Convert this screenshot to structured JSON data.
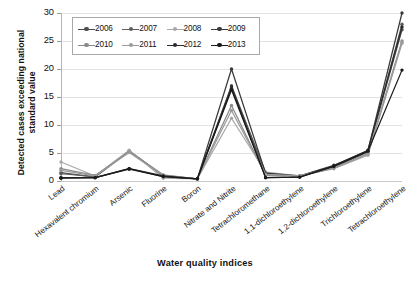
{
  "chart_data": {
    "type": "line",
    "title": "",
    "xlabel": "Water quality indices",
    "ylabel": "Detected cases exceeding national standard value",
    "ylim": [
      0,
      30
    ],
    "yticks": [
      0,
      5,
      10,
      15,
      20,
      25,
      30
    ],
    "grid": true,
    "legend_position": "top-left",
    "categories": [
      "Lead",
      "Hexavalent chromium",
      "Arsenic",
      "Fluorine",
      "Boron",
      "Nitrate and Nitrite",
      "Tetrachloromethane",
      "1,1-dichloroethylene",
      "1,2-dichloroethylene",
      "Trichloroethylene",
      "Tetrachloroethylene"
    ],
    "series": [
      {
        "name": "2006",
        "color": "#4d4d4d",
        "values": [
          1.5,
          0.7,
          5.3,
          0.9,
          0.4,
          17.0,
          1.5,
          0.8,
          2.6,
          5.3,
          27.0
        ]
      },
      {
        "name": "2007",
        "color": "#5e5e5e",
        "values": [
          1.3,
          0.8,
          5.4,
          1.0,
          0.4,
          16.5,
          1.4,
          0.8,
          2.5,
          5.2,
          28.0
        ]
      },
      {
        "name": "2008",
        "color": "#a8a8a8",
        "values": [
          3.4,
          0.9,
          5.5,
          0.5,
          0.4,
          11.2,
          1.6,
          0.9,
          2.2,
          4.6,
          24.6
        ]
      },
      {
        "name": "2009",
        "color": "#3a3a3a",
        "values": [
          0.6,
          0.6,
          2.1,
          0.8,
          0.4,
          20.0,
          1.4,
          0.9,
          2.8,
          5.4,
          30.0
        ]
      },
      {
        "name": "2010",
        "color": "#8b8b8b",
        "values": [
          2.2,
          1.0,
          5.2,
          1.1,
          0.4,
          13.5,
          1.0,
          0.9,
          2.3,
          4.9,
          25.0
        ]
      },
      {
        "name": "2011",
        "color": "#9b9b9b",
        "values": [
          1.9,
          0.9,
          5.1,
          1.0,
          0.4,
          12.6,
          1.2,
          0.9,
          2.4,
          4.8,
          24.8
        ]
      },
      {
        "name": "2012",
        "color": "#2b2b2b",
        "values": [
          0.6,
          0.6,
          2.2,
          0.9,
          0.4,
          16.8,
          0.6,
          0.7,
          2.7,
          5.5,
          27.5
        ]
      },
      {
        "name": "2013",
        "color": "#1a1a1a",
        "values": [
          0.5,
          0.6,
          2.2,
          0.8,
          0.4,
          16.3,
          0.6,
          0.7,
          2.6,
          5.3,
          19.8
        ]
      }
    ]
  },
  "axes": {
    "y_title": "Detected cases exceeding national standard value",
    "x_title": "Water quality indices"
  }
}
